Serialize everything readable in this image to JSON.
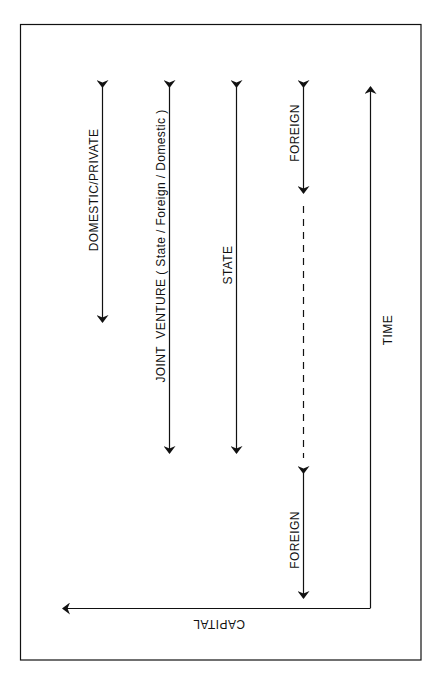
{
  "diagram": {
    "type": "timeline-of-capital-sources",
    "colors": {
      "ink": "#111111",
      "background": "#ffffff"
    },
    "axes": {
      "time_label": "TIME",
      "capital_label": "CAPITAL"
    },
    "bands": [
      {
        "id": "domestic-private",
        "label": "DOMESTIC/PRIVATE",
        "style": "double-arrow-solid"
      },
      {
        "id": "joint-venture",
        "label": "JOINT  VENTURE ( State / Foreign / Domestic )",
        "style": "double-arrow-solid"
      },
      {
        "id": "state",
        "label": "STATE",
        "style": "double-arrow-solid"
      },
      {
        "id": "foreign-early",
        "label": "FOREIGN",
        "style": "double-arrow-solid"
      },
      {
        "id": "foreign-gap",
        "label": "",
        "style": "dashed-line"
      },
      {
        "id": "foreign-late",
        "label": "FOREIGN",
        "style": "double-arrow-solid"
      }
    ]
  }
}
